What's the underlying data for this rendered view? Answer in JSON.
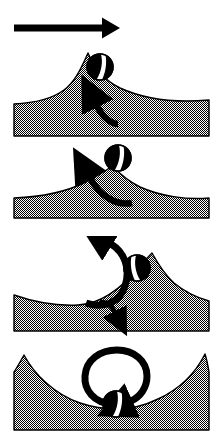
{
  "figure": {
    "width": 218,
    "height": 442,
    "background_color": "#ffffff",
    "ink_color": "#000000",
    "terrain_fill_color": "#808080",
    "terrain_fill_style": "50% checkerboard dither",
    "terrain_outline_color": "#000000",
    "ball": {
      "body_color": "#000000",
      "stripe_color": "#ffffff",
      "outline_color": "#000000",
      "radius": 13,
      "semantic": "striped-ball"
    },
    "direction_arrow": {
      "label": "motion-direction-arrow",
      "orientation": "horizontal, pointing right",
      "x_start": 14,
      "x_end": 120,
      "y": 28,
      "thickness": 7
    },
    "panels": [
      {
        "index": 1,
        "name": "panel-1",
        "caption": "Ball just past hill crest, rotation arrow curving up-left",
        "top": 45,
        "bottom": 136,
        "left": 14,
        "right": 209,
        "peak_x": 88,
        "peak_y": 53,
        "ball_x": 100,
        "ball_y": 67,
        "ball_stripe_angle": 20,
        "arrow_kind": "small-curved-arrow",
        "arrow_direction": "up-left"
      },
      {
        "index": 2,
        "name": "panel-2",
        "caption": "Ball at hill crest, rotation arrow curving up-left",
        "top": 145,
        "bottom": 218,
        "left": 14,
        "right": 209,
        "peak_x": 112,
        "peak_y": 166,
        "ball_x": 118,
        "ball_y": 158,
        "ball_stripe_angle": 20,
        "arrow_kind": "medium-curved-arrow",
        "arrow_direction": "up-left"
      },
      {
        "index": 3,
        "name": "panel-3",
        "caption": "Ball on upslope left of crest, large circular arrow turning clockwise",
        "top": 240,
        "bottom": 331,
        "left": 14,
        "right": 209,
        "peak_x": 152,
        "peak_y": 253,
        "valley_x": 78,
        "ball_x": 137,
        "ball_y": 268,
        "ball_stripe_angle": -20,
        "arrow_kind": "large-circular-arrow",
        "arrow_direction": "clockwise, head at upper right"
      },
      {
        "index": 4,
        "name": "panel-4",
        "caption": "Ball at bottom of valley, full circular arrow turning clockwise",
        "top": 348,
        "bottom": 430,
        "left": 14,
        "right": 209,
        "valley_x": 116,
        "valley_y": 404,
        "left_peak_x": 24,
        "right_peak_x": 205,
        "ball_x": 116,
        "ball_y": 404,
        "ball_stripe_angle": 20,
        "arrow_kind": "full-circle-arrow",
        "arrow_direction": "clockwise, head at lower right"
      }
    ]
  }
}
